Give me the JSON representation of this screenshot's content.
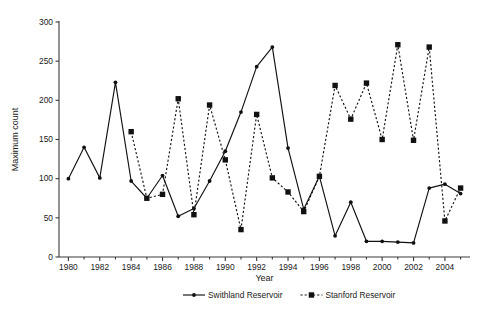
{
  "chart_data": {
    "type": "line",
    "title": "",
    "xlabel": "Year",
    "ylabel": "Maximum count",
    "xlim": [
      1979.3,
      1985.0
    ],
    "ylim": [
      0,
      300
    ],
    "yticks": [
      0,
      50,
      100,
      150,
      200,
      250,
      300
    ],
    "xticks": [
      1980,
      1982,
      1984,
      1986,
      1988,
      1990,
      1992,
      1994,
      1996,
      1998,
      2000,
      2002,
      2004
    ],
    "xtick_labels": [
      "1980",
      "1982",
      "1984",
      "1986",
      "1988",
      "1990",
      "1992",
      "1994",
      "1996",
      "1998",
      "2000",
      "2002",
      "2004"
    ],
    "ytick_labels": [
      "0",
      "50",
      "100",
      "150",
      "200",
      "250",
      "300"
    ],
    "grid": false,
    "legend_position": "bottom",
    "series": [
      {
        "name": "Swithland Reservoir",
        "marker": "circle",
        "linestyle": "solid",
        "color": "#111111",
        "x": [
          1980,
          1981,
          1982,
          1983,
          1984,
          1985,
          1986,
          1987,
          1988,
          1989,
          1990,
          1991,
          1992,
          1993,
          1994,
          1995,
          1996,
          1997,
          1998,
          1999,
          2000,
          2001,
          2002,
          2003,
          2004,
          2005
        ],
        "values": [
          100,
          140,
          101,
          223,
          97,
          75,
          104,
          52,
          62,
          97,
          135,
          185,
          243,
          268,
          139,
          61,
          103,
          27,
          70,
          20,
          20,
          19,
          18,
          88,
          93,
          81
        ]
      },
      {
        "name": "Stanford Reservoir",
        "marker": "square",
        "linestyle": "dashed",
        "color": "#111111",
        "x": [
          1984,
          1985,
          1986,
          1987,
          1988,
          1989,
          1990,
          1991,
          1992,
          1993,
          1994,
          1995,
          1996,
          1997,
          1998,
          1999,
          2000,
          2001,
          2002,
          2003,
          2004,
          2005
        ],
        "values": [
          160,
          75,
          80,
          202,
          54,
          194,
          124,
          35,
          182,
          101,
          83,
          58,
          103,
          219,
          176,
          222,
          150,
          271,
          149,
          268,
          46,
          88
        ]
      }
    ]
  },
  "legend": {
    "items": [
      {
        "label": "Swithland Reservoir",
        "marker": "circle",
        "linestyle": "solid"
      },
      {
        "label": "Stanford Reservoir",
        "marker": "square",
        "linestyle": "dashed"
      }
    ]
  },
  "axes": {
    "y_title": "Maximum count",
    "x_title": "Year"
  }
}
